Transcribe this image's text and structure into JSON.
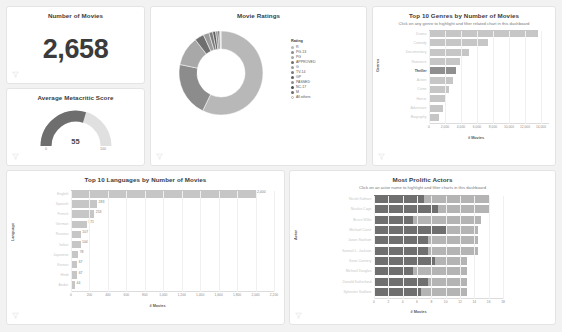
{
  "kpi": {
    "title": "Number of Movies",
    "value": "2,658",
    "filter_icon": "filter-funnel-icon"
  },
  "gauge": {
    "title": "Average Metacritic Score",
    "value": "55",
    "min": "0",
    "max": "100",
    "value_num": 55,
    "range": [
      0,
      100
    ],
    "fill_color": "#6e6e6e",
    "track_color": "#e0e0e0"
  },
  "donut": {
    "title": "Movie Ratings",
    "legend_title": "Rating",
    "chart_data": {
      "type": "pie",
      "title": "Movie Ratings",
      "legend_position": "right",
      "categories": [
        "R",
        "PG-13",
        "PG",
        "APPROVED",
        "G",
        "TV-14",
        "GP",
        "PASSED",
        "NC-17",
        "M",
        "All others"
      ],
      "values": [
        1520,
        560,
        300,
        95,
        60,
        38,
        30,
        24,
        16,
        10,
        5
      ],
      "colors": [
        "#b8b8b8",
        "#8c8c8c",
        "#a8a8a8",
        "#6f6f6f",
        "#9c9c9c",
        "#7c7c7c",
        "#5f5f5f",
        "#8f8f8f",
        "#4f4f4f",
        "#6a6a6a",
        "#d8d8d8"
      ]
    }
  },
  "genres": {
    "title": "Top 10 Genres by Number of Movies",
    "subtitle": "Click on any genre to highlight and filter related chart in this dashboard",
    "ylabel": "Genres",
    "xlabel": "# Movies",
    "highlighted": "Thriller",
    "chart_data": {
      "type": "bar",
      "orientation": "horizontal",
      "title": "Top 10 Genres by Number of Movies",
      "xlabel": "# Movies",
      "ylabel": "Genres",
      "xlim": [
        0,
        15000
      ],
      "ticks": [
        "0",
        "2,000",
        "4,000",
        "6,000",
        "8,000",
        "10,000",
        "12,000",
        "14,000"
      ],
      "tick_values": [
        0,
        2000,
        4000,
        6000,
        8000,
        10000,
        12000,
        14000
      ],
      "categories": [
        "Drama",
        "Comedy",
        "Documentary",
        "Romance",
        "Thriller",
        "Action",
        "Crime",
        "Horror",
        "Adventure",
        "Biography"
      ],
      "values": [
        13600,
        7400,
        5000,
        3900,
        3400,
        3000,
        2500,
        2100,
        1800,
        1300
      ]
    }
  },
  "languages": {
    "title": "Top 10 Languages by Number of Movies",
    "ylabel": "Language",
    "xlabel": "# Movies",
    "chart_data": {
      "type": "bar",
      "orientation": "horizontal",
      "title": "Top 10 Languages by Number of Movies",
      "xlabel": "# Movies",
      "ylabel": "Language",
      "xlim": [
        0,
        2200
      ],
      "ticks": [
        "0",
        "200",
        "400",
        "600",
        "800",
        "1,000",
        "1,200",
        "1,400",
        "1,600",
        "1,800",
        "2,000",
        "2,200"
      ],
      "tick_values": [
        0,
        200,
        400,
        600,
        800,
        1000,
        1200,
        1400,
        1600,
        1800,
        2000,
        2200
      ],
      "categories": [
        "English",
        "Spanish",
        "French",
        "German",
        "Russian",
        "Italian",
        "Japanese",
        "Korean",
        "Hindi",
        "Arabic"
      ],
      "values": [
        2000,
        283,
        253,
        171,
        107,
        104,
        78,
        67,
        67,
        44
      ],
      "labels": [
        "2,000",
        "283",
        "253",
        "171",
        "107",
        "104",
        "78",
        "67",
        "67",
        "44"
      ]
    }
  },
  "actors": {
    "title": "Most Prolific Actors",
    "subtitle": "Click on an actor name to highlight and filter charts in this dashboard",
    "ylabel": "Actor",
    "xlabel": "# Movies",
    "legend_title": "Tomato meter",
    "legend": [
      "Fresh",
      "Not Rated",
      "Rotten"
    ],
    "legend_colors": [
      "#6f6f6f",
      "#b4b4b4",
      "#ffffff"
    ],
    "chart_data": {
      "type": "bar",
      "orientation": "horizontal",
      "stacked": true,
      "title": "Most Prolific Actors",
      "xlabel": "# Movies",
      "ylabel": "Actor",
      "xlim": [
        0,
        18
      ],
      "ticks": [
        "0",
        "2",
        "4",
        "6",
        "8",
        "10",
        "12",
        "14",
        "16",
        "18"
      ],
      "tick_values": [
        0,
        2,
        4,
        6,
        8,
        10,
        12,
        14,
        16,
        18
      ],
      "categories": [
        "Nicole Kidman",
        "Nicolas Cage",
        "Bruce Willis",
        "Michael Caine",
        "Jason Statham",
        "Samuel L. Jackson",
        "Sean Connery",
        "Michael Douglas",
        "Donald Sutherland",
        "Sylvester Stallone"
      ],
      "series": [
        {
          "name": "Fresh",
          "values": [
            7,
            9,
            5.5,
            10,
            7.5,
            7.5,
            8.5,
            5.5,
            7.5,
            6.5
          ]
        },
        {
          "name": "Not Rated",
          "values": [
            9,
            7,
            9.5,
            4.5,
            7,
            7,
            4.5,
            7.5,
            5.5,
            6.5
          ]
        },
        {
          "name": "Rotten",
          "values": [
            0,
            0,
            0,
            0,
            0,
            0,
            0,
            0,
            0,
            0
          ]
        }
      ],
      "totals": [
        16,
        16,
        15,
        14.5,
        14.5,
        14.5,
        13,
        13,
        13,
        13
      ]
    }
  }
}
